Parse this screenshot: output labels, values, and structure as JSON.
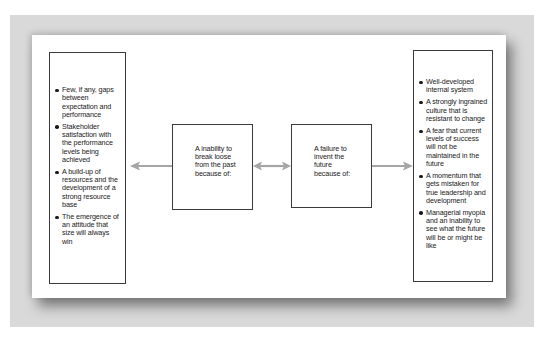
{
  "diagram": {
    "left_box": {
      "items": [
        "Few, if any, gaps between expectation and performance",
        "Stakeholder satisfaction with the performance levels being achieved",
        "A build-up of resources and the development of a strong resource base",
        "The emergence of an attitude that size will always win"
      ]
    },
    "middle_left_box": {
      "text": "A inability to break loose from the past because of:"
    },
    "middle_right_box": {
      "text": "A failure to invent the future because of:"
    },
    "right_box": {
      "items": [
        "Well-developed internal system",
        "A strongly ingrained culture that is resistant to change",
        "A fear that current levels of success will not be maintained in the future",
        "A momentum that gets mistaken for true leadership and development",
        "Managerial myopia and an inability to see what the future will be or might be like"
      ]
    },
    "arrows": [
      {
        "from": "middle_left_box",
        "to": "left_box",
        "type": "single"
      },
      {
        "from": "middle_left_box",
        "to": "middle_right_box",
        "type": "double"
      },
      {
        "from": "middle_right_box",
        "to": "right_box",
        "type": "single"
      }
    ],
    "colors": {
      "frame": "#d9d9d9",
      "arrow": "#a6a6a6",
      "box_border": "#3a3a3a",
      "text": "#1a1a1a"
    }
  }
}
